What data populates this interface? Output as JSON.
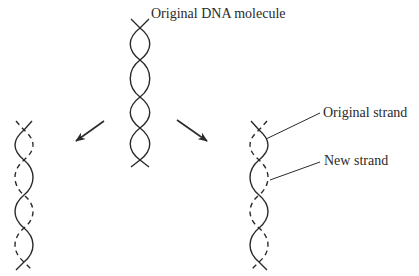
{
  "diagram": {
    "labels": {
      "parent": "Original DNA molecule",
      "original_strand": "Original strand",
      "new_strand": "New strand"
    },
    "colors": {
      "stroke": "#2a2a2a",
      "background": "#ffffff"
    },
    "nodes": [
      {
        "id": "parent",
        "label": "Original DNA molecule",
        "strands": [
          "original",
          "original"
        ]
      },
      {
        "id": "daughter-left",
        "strands": [
          "original",
          "new"
        ]
      },
      {
        "id": "daughter-right",
        "strands": [
          "original",
          "new"
        ]
      }
    ],
    "edges": [
      {
        "from": "parent",
        "to": "daughter-left",
        "type": "arrow"
      },
      {
        "from": "parent",
        "to": "daughter-right",
        "type": "arrow"
      }
    ],
    "legend": [
      {
        "style": "solid",
        "meaning": "Original strand"
      },
      {
        "style": "dashed",
        "meaning": "New strand"
      }
    ]
  }
}
